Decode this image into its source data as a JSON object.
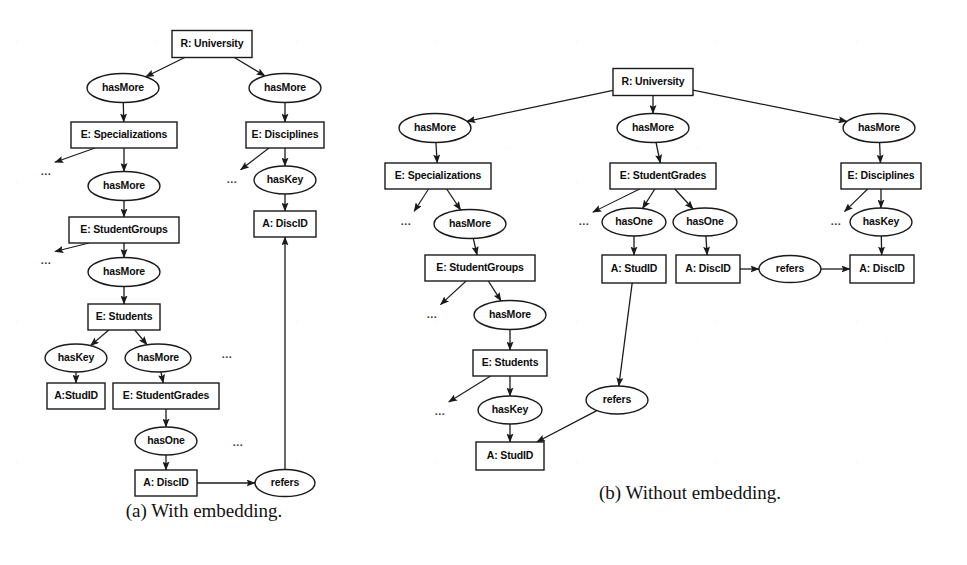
{
  "figure": {
    "width": 967,
    "height": 565,
    "background_color": "#ffffff",
    "line_color": "#1a1a1a",
    "text_color": "#0d0d0d"
  },
  "ellipsis_text": "...",
  "subfigures": [
    {
      "id": "a",
      "caption": "(a) With embedding.",
      "caption_x": 204,
      "caption_y": 513
    },
    {
      "id": "b",
      "caption": "(b) Without embedding.",
      "caption_x": 690,
      "caption_y": 495
    }
  ],
  "diagram_a": {
    "nodes": [
      {
        "id": "a-root",
        "label": "R: University",
        "shape": "box",
        "cx": 212,
        "cy": 44,
        "w": 80,
        "h": 27
      },
      {
        "id": "a-hasmore-1",
        "label": "hasMore",
        "shape": "ellipse",
        "cx": 123,
        "cy": 88,
        "w": 72,
        "h": 29
      },
      {
        "id": "a-hasmore-2",
        "label": "hasMore",
        "shape": "ellipse",
        "cx": 285,
        "cy": 88,
        "w": 72,
        "h": 29
      },
      {
        "id": "a-specializations",
        "label": "E: Specializations",
        "shape": "box",
        "cx": 124,
        "cy": 135,
        "w": 106,
        "h": 26
      },
      {
        "id": "a-disciplines",
        "label": "E: Disciplines",
        "shape": "box",
        "cx": 285,
        "cy": 135,
        "w": 78,
        "h": 26
      },
      {
        "id": "a-hasmore-3",
        "label": "hasMore",
        "shape": "ellipse",
        "cx": 124,
        "cy": 186,
        "w": 72,
        "h": 29
      },
      {
        "id": "a-haskey-1",
        "label": "hasKey",
        "shape": "ellipse",
        "cx": 285,
        "cy": 180,
        "w": 62,
        "h": 28
      },
      {
        "id": "a-studentgroups",
        "label": "E: StudentGroups",
        "shape": "box",
        "cx": 124,
        "cy": 230,
        "w": 110,
        "h": 26
      },
      {
        "id": "a-discid-top",
        "label": "A: DiscID",
        "shape": "box",
        "cx": 285,
        "cy": 224,
        "w": 62,
        "h": 26
      },
      {
        "id": "a-hasmore-4",
        "label": "hasMore",
        "shape": "ellipse",
        "cx": 124,
        "cy": 272,
        "w": 72,
        "h": 29
      },
      {
        "id": "a-students",
        "label": "E: Students",
        "shape": "box",
        "cx": 124,
        "cy": 317,
        "w": 72,
        "h": 26
      },
      {
        "id": "a-haskey-2",
        "label": "hasKey",
        "shape": "ellipse",
        "cx": 76,
        "cy": 358,
        "w": 62,
        "h": 28
      },
      {
        "id": "a-hasmore-5",
        "label": "hasMore",
        "shape": "ellipse",
        "cx": 158,
        "cy": 358,
        "w": 66,
        "h": 28
      },
      {
        "id": "a-studid",
        "label": "A:StudID",
        "shape": "box",
        "cx": 76,
        "cy": 396,
        "w": 58,
        "h": 26
      },
      {
        "id": "a-studentgrades",
        "label": "E: StudentGrades",
        "shape": "box",
        "cx": 166,
        "cy": 396,
        "w": 106,
        "h": 26
      },
      {
        "id": "a-hasone",
        "label": "hasOne",
        "shape": "ellipse",
        "cx": 166,
        "cy": 441,
        "w": 62,
        "h": 28
      },
      {
        "id": "a-discid-bottom",
        "label": "A: DiscID",
        "shape": "box",
        "cx": 166,
        "cy": 483,
        "w": 62,
        "h": 26
      },
      {
        "id": "a-refers",
        "label": "refers",
        "shape": "ellipse",
        "cx": 285,
        "cy": 483,
        "w": 60,
        "h": 27
      }
    ],
    "ellipses_marks": [
      {
        "x": 46,
        "y": 172
      },
      {
        "x": 46,
        "y": 261
      },
      {
        "x": 232,
        "y": 180
      },
      {
        "x": 227,
        "y": 355
      },
      {
        "x": 238,
        "y": 443
      }
    ],
    "edges": [
      {
        "from": "a-root",
        "to": "a-hasmore-1",
        "type": "arrow"
      },
      {
        "from": "a-root",
        "to": "a-hasmore-2",
        "type": "arrow"
      },
      {
        "from": "a-hasmore-1",
        "to": "a-specializations",
        "type": "arrow"
      },
      {
        "from": "a-hasmore-2",
        "to": "a-disciplines",
        "type": "arrow"
      },
      {
        "from": "a-specializations",
        "to": "a-hasmore-3",
        "type": "arrow"
      },
      {
        "from": "a-disciplines",
        "to": "a-haskey-1",
        "type": "arrow"
      },
      {
        "from": "a-hasmore-3",
        "to": "a-studentgroups",
        "type": "arrow"
      },
      {
        "from": "a-haskey-1",
        "to": "a-discid-top",
        "type": "arrow"
      },
      {
        "from": "a-studentgroups",
        "to": "a-hasmore-4",
        "type": "arrow"
      },
      {
        "from": "a-hasmore-4",
        "to": "a-students",
        "type": "arrow"
      },
      {
        "from": "a-students",
        "to": "a-haskey-2",
        "type": "arrow"
      },
      {
        "from": "a-students",
        "to": "a-hasmore-5",
        "type": "arrow"
      },
      {
        "from": "a-haskey-2",
        "to": "a-studid",
        "type": "arrow"
      },
      {
        "from": "a-hasmore-5",
        "to": "a-studentgrades",
        "type": "arrow"
      },
      {
        "from": "a-studentgrades",
        "to": "a-hasone",
        "type": "arrow"
      },
      {
        "from": "a-hasone",
        "to": "a-discid-bottom",
        "type": "arrow"
      },
      {
        "from": "a-discid-bottom",
        "to": "a-refers",
        "type": "arrow"
      },
      {
        "from": "a-refers",
        "to": "a-discid-top",
        "type": "arrow"
      }
    ]
  },
  "diagram_b": {
    "nodes": [
      {
        "id": "b-root",
        "label": "R: University",
        "shape": "box",
        "cx": 653,
        "cy": 82,
        "w": 80,
        "h": 27
      },
      {
        "id": "b-hasmore-left",
        "label": "hasMore",
        "shape": "ellipse",
        "cx": 435,
        "cy": 128,
        "w": 72,
        "h": 29
      },
      {
        "id": "b-hasmore-mid",
        "label": "hasMore",
        "shape": "ellipse",
        "cx": 653,
        "cy": 128,
        "w": 72,
        "h": 29
      },
      {
        "id": "b-hasmore-right",
        "label": "hasMore",
        "shape": "ellipse",
        "cx": 879,
        "cy": 128,
        "w": 72,
        "h": 29
      },
      {
        "id": "b-specializations",
        "label": "E: Specializations",
        "shape": "box",
        "cx": 438,
        "cy": 176,
        "w": 106,
        "h": 26
      },
      {
        "id": "b-studentgrades",
        "label": "E: StudentGrades",
        "shape": "box",
        "cx": 663,
        "cy": 176,
        "w": 106,
        "h": 26
      },
      {
        "id": "b-disciplines",
        "label": "E: Disciplines",
        "shape": "box",
        "cx": 881,
        "cy": 176,
        "w": 80,
        "h": 26
      },
      {
        "id": "b-hasmore-2",
        "label": "hasMore",
        "shape": "ellipse",
        "cx": 470,
        "cy": 224,
        "w": 72,
        "h": 29
      },
      {
        "id": "b-hasone-1",
        "label": "hasOne",
        "shape": "ellipse",
        "cx": 634,
        "cy": 222,
        "w": 64,
        "h": 28
      },
      {
        "id": "b-hasone-2",
        "label": "hasOne",
        "shape": "ellipse",
        "cx": 705,
        "cy": 222,
        "w": 64,
        "h": 28
      },
      {
        "id": "b-haskey-right",
        "label": "hasKey",
        "shape": "ellipse",
        "cx": 881,
        "cy": 222,
        "w": 62,
        "h": 28
      },
      {
        "id": "b-studentgroups",
        "label": "E: StudentGroups",
        "shape": "box",
        "cx": 480,
        "cy": 268,
        "w": 110,
        "h": 26
      },
      {
        "id": "b-studid-mid",
        "label": "A: StudID",
        "shape": "box",
        "cx": 634,
        "cy": 269,
        "w": 64,
        "h": 28
      },
      {
        "id": "b-discid-mid",
        "label": "A: DiscID",
        "shape": "box",
        "cx": 708,
        "cy": 269,
        "w": 64,
        "h": 28
      },
      {
        "id": "b-refers-right",
        "label": "refers",
        "shape": "ellipse",
        "cx": 790,
        "cy": 269,
        "w": 62,
        "h": 27
      },
      {
        "id": "b-discid-right",
        "label": "A: DiscID",
        "shape": "box",
        "cx": 882,
        "cy": 269,
        "w": 64,
        "h": 28
      },
      {
        "id": "b-hasmore-3",
        "label": "hasMore",
        "shape": "ellipse",
        "cx": 510,
        "cy": 315,
        "w": 72,
        "h": 29
      },
      {
        "id": "b-students",
        "label": "E: Students",
        "shape": "box",
        "cx": 510,
        "cy": 363,
        "w": 74,
        "h": 26
      },
      {
        "id": "b-haskey-left",
        "label": "hasKey",
        "shape": "ellipse",
        "cx": 510,
        "cy": 410,
        "w": 64,
        "h": 28
      },
      {
        "id": "b-refers-mid",
        "label": "refers",
        "shape": "ellipse",
        "cx": 617,
        "cy": 400,
        "w": 62,
        "h": 28
      },
      {
        "id": "b-studid-left",
        "label": "A: StudID",
        "shape": "box",
        "cx": 510,
        "cy": 456,
        "w": 68,
        "h": 28
      }
    ],
    "ellipses_marks": [
      {
        "x": 406,
        "y": 222
      },
      {
        "x": 584,
        "y": 222
      },
      {
        "x": 836,
        "y": 222
      },
      {
        "x": 432,
        "y": 315
      },
      {
        "x": 440,
        "y": 412
      }
    ],
    "edges": [
      {
        "from": "b-root",
        "to": "b-hasmore-left",
        "type": "arrow"
      },
      {
        "from": "b-root",
        "to": "b-hasmore-mid",
        "type": "arrow"
      },
      {
        "from": "b-root",
        "to": "b-hasmore-right",
        "type": "arrow"
      },
      {
        "from": "b-hasmore-left",
        "to": "b-specializations",
        "type": "arrow"
      },
      {
        "from": "b-hasmore-mid",
        "to": "b-studentgrades",
        "type": "arrow"
      },
      {
        "from": "b-hasmore-right",
        "to": "b-disciplines",
        "type": "arrow"
      },
      {
        "from": "b-specializations",
        "to": "b-hasmore-2",
        "type": "arrow"
      },
      {
        "from": "b-studentgrades",
        "to": "b-hasone-1",
        "type": "arrow"
      },
      {
        "from": "b-studentgrades",
        "to": "b-hasone-2",
        "type": "arrow"
      },
      {
        "from": "b-disciplines",
        "to": "b-haskey-right",
        "type": "arrow"
      },
      {
        "from": "b-hasmore-2",
        "to": "b-studentgroups",
        "type": "arrow"
      },
      {
        "from": "b-hasone-1",
        "to": "b-studid-mid",
        "type": "arrow"
      },
      {
        "from": "b-hasone-2",
        "to": "b-discid-mid",
        "type": "arrow"
      },
      {
        "from": "b-haskey-right",
        "to": "b-discid-right",
        "type": "arrow"
      },
      {
        "from": "b-discid-mid",
        "to": "b-refers-right",
        "type": "arrow"
      },
      {
        "from": "b-refers-right",
        "to": "b-discid-right",
        "type": "arrow"
      },
      {
        "from": "b-studentgroups",
        "to": "b-hasmore-3",
        "type": "arrow"
      },
      {
        "from": "b-hasmore-3",
        "to": "b-students",
        "type": "arrow"
      },
      {
        "from": "b-students",
        "to": "b-haskey-left",
        "type": "arrow"
      },
      {
        "from": "b-haskey-left",
        "to": "b-studid-left",
        "type": "arrow"
      },
      {
        "from": "b-studid-mid",
        "to": "b-refers-mid",
        "type": "arrow"
      },
      {
        "from": "b-refers-mid",
        "to": "b-studid-left",
        "type": "arrow"
      }
    ]
  }
}
